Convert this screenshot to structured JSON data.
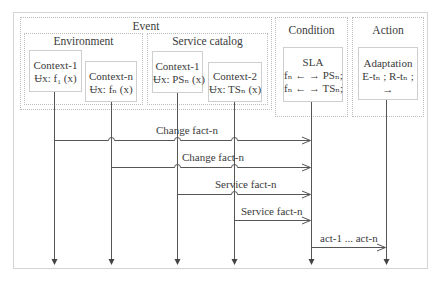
{
  "groups": {
    "event": {
      "title": "Event"
    },
    "environment": {
      "title": "Environment"
    },
    "service_catalog": {
      "title": "Service catalog"
    },
    "condition": {
      "title": "Condition"
    },
    "action": {
      "title": "Action"
    }
  },
  "nodes": {
    "env_context1": {
      "line1": "Context-1",
      "line2": "Ʉx: f₁ (x)"
    },
    "env_contextn": {
      "line1": "Context-n",
      "line2": "Ʉx: fₙ (x)"
    },
    "svc_context1": {
      "line1": "Context-1",
      "line2": "Ʉx: PSₙ (x)"
    },
    "svc_context2": {
      "line1": "Context-2",
      "line2": "Ʉx: TSₙ (x)"
    },
    "sla": {
      "line1": "SLA",
      "line2": "fₙ ← → PSₙ;",
      "line3": "fₙ ← → TSₙ;"
    },
    "adaptation": {
      "line1": "Adaptation",
      "line2": "E-tₙ ; R-tₙ ;",
      "line3": "→"
    }
  },
  "messages": [
    {
      "label": "Change fact-n",
      "from": "env_context1",
      "to": "sla"
    },
    {
      "label": "Change fact-n",
      "from": "env_contextn",
      "to": "sla"
    },
    {
      "label": "Service fact-n",
      "from": "svc_context1",
      "to": "sla"
    },
    {
      "label": "Service fact-n",
      "from": "svc_context2",
      "to": "sla"
    },
    {
      "label": "act-1 ... act-n",
      "from": "sla",
      "to": "adaptation"
    }
  ],
  "colors": {
    "line": "#555555",
    "frame": "#d4d4d4",
    "dotted": "#bdbdbd",
    "text": "#3b3b3b"
  }
}
